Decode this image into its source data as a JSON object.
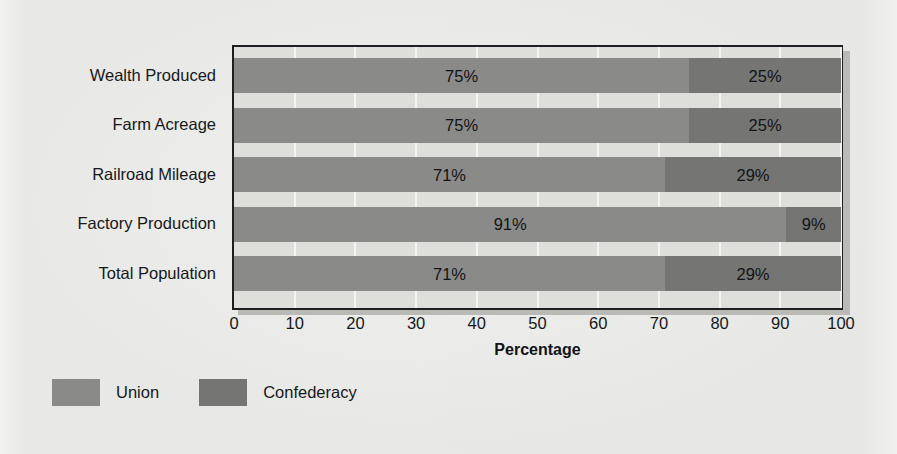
{
  "chart_data": {
    "type": "bar",
    "orientation": "horizontal",
    "stacked": true,
    "title": "",
    "xlabel": "Percentage",
    "ylabel": "",
    "xlim": [
      0,
      100
    ],
    "xticks": [
      "0",
      "10",
      "20",
      "30",
      "40",
      "50",
      "60",
      "70",
      "80",
      "90",
      "100"
    ],
    "grid": true,
    "legend_position": "bottom-left",
    "categories": [
      "Wealth Produced",
      "Farm Acreage",
      "Railroad Mileage",
      "Factory Production",
      "Total Population"
    ],
    "series": [
      {
        "name": "Union",
        "color": "#8a8a88",
        "values": [
          75,
          75,
          71,
          91,
          71
        ],
        "labels": [
          "75%",
          "75%",
          "71%",
          "91%",
          "71%"
        ]
      },
      {
        "name": "Confederacy",
        "color": "#757573",
        "values": [
          25,
          25,
          29,
          9,
          29
        ],
        "labels": [
          "25%",
          "25%",
          "29%",
          "9%",
          "29%"
        ]
      }
    ]
  },
  "legend": {
    "items": [
      {
        "label": "Union",
        "color": "#8a8a88"
      },
      {
        "label": "Confederacy",
        "color": "#757573"
      }
    ]
  },
  "axis": {
    "x_title": "Percentage"
  }
}
